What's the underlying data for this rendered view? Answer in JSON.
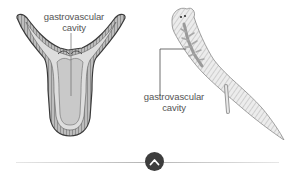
{
  "diagram": {
    "hydra": {
      "label_line1": "gastrovascular",
      "label_line2": "cavity",
      "label": "gastrovascular cavity"
    },
    "planarian": {
      "label_line1": "gastrovascular",
      "label_line2": "cavity",
      "label": "gastrovascular cavity"
    }
  },
  "controls": {
    "collapse_button": {
      "icon": "chevron-up-icon",
      "color": "#3d3d3d"
    }
  },
  "colors": {
    "outline": "#4a4a4a",
    "cavity_fill": "#cfcfcf",
    "body_wall": "#9a9a9a",
    "label_text": "#555555"
  }
}
